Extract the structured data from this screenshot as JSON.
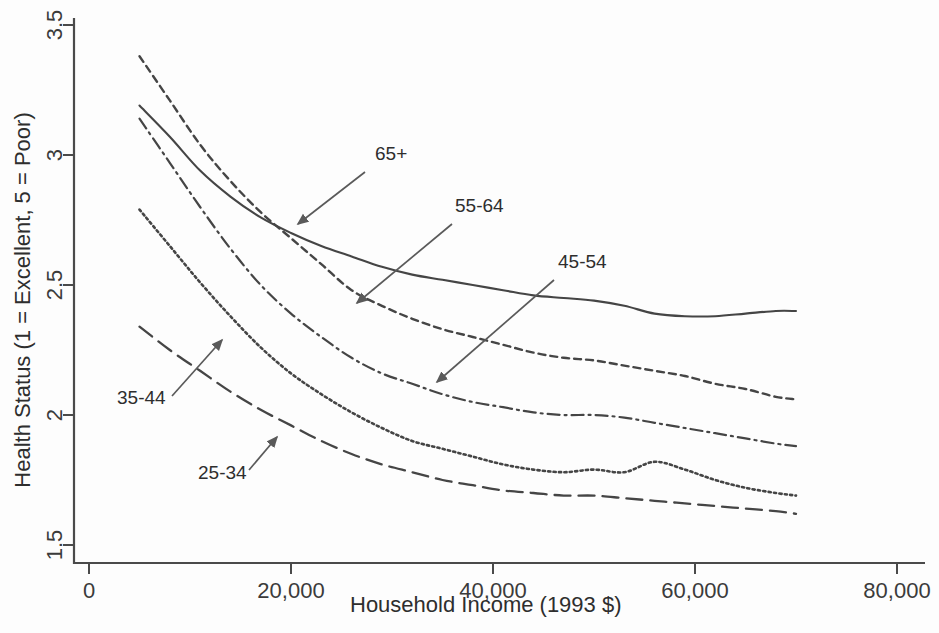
{
  "chart_data": {
    "type": "line",
    "title": "",
    "xlabel": "Household Income (1993 $)",
    "ylabel": "Health Status (1 = Excellent, 5 = Poor)",
    "xlim": [
      0,
      80000
    ],
    "ylim": [
      1.5,
      3.5
    ],
    "grid": false,
    "legend_position": "inline-annotations",
    "xticks": [
      "0",
      "20,000",
      "40,000",
      "60,000",
      "80,000"
    ],
    "xtick_values": [
      0,
      20000,
      40000,
      60000,
      80000
    ],
    "yticks": [
      "1.5",
      "2",
      "2.5",
      "3",
      "3.5"
    ],
    "ytick_values": [
      1.5,
      2,
      2.5,
      3,
      3.5
    ],
    "x": [
      5000,
      8000,
      11000,
      14000,
      17000,
      20000,
      23000,
      26000,
      29000,
      32000,
      35000,
      38000,
      41000,
      44000,
      47000,
      50000,
      53000,
      56000,
      59000,
      62000,
      65000,
      68000,
      70000
    ],
    "series": [
      {
        "name": "65+",
        "style": "solid",
        "values": [
          3.19,
          3.07,
          2.94,
          2.84,
          2.76,
          2.7,
          2.65,
          2.61,
          2.57,
          2.54,
          2.52,
          2.5,
          2.48,
          2.46,
          2.45,
          2.44,
          2.42,
          2.39,
          2.38,
          2.38,
          2.39,
          2.4,
          2.4
        ]
      },
      {
        "name": "55-64",
        "style": "dashed",
        "values": [
          3.38,
          3.21,
          3.04,
          2.9,
          2.78,
          2.68,
          2.58,
          2.48,
          2.42,
          2.37,
          2.33,
          2.3,
          2.27,
          2.24,
          2.22,
          2.21,
          2.19,
          2.17,
          2.15,
          2.12,
          2.1,
          2.07,
          2.06
        ]
      },
      {
        "name": "45-54",
        "style": "dashdot",
        "values": [
          3.14,
          2.97,
          2.8,
          2.64,
          2.5,
          2.39,
          2.3,
          2.22,
          2.16,
          2.12,
          2.08,
          2.05,
          2.03,
          2.01,
          2.0,
          2.0,
          1.99,
          1.97,
          1.95,
          1.93,
          1.91,
          1.89,
          1.88
        ]
      },
      {
        "name": "35-44",
        "style": "dotted",
        "values": [
          2.79,
          2.65,
          2.51,
          2.38,
          2.26,
          2.16,
          2.08,
          2.01,
          1.95,
          1.9,
          1.87,
          1.84,
          1.81,
          1.79,
          1.78,
          1.79,
          1.78,
          1.82,
          1.79,
          1.75,
          1.72,
          1.7,
          1.69
        ]
      },
      {
        "name": "25-34",
        "style": "longdash",
        "values": [
          2.34,
          2.25,
          2.17,
          2.09,
          2.02,
          1.96,
          1.9,
          1.85,
          1.81,
          1.78,
          1.75,
          1.73,
          1.71,
          1.7,
          1.69,
          1.69,
          1.68,
          1.67,
          1.66,
          1.65,
          1.64,
          1.63,
          1.62
        ]
      }
    ],
    "annotations": [
      {
        "text": "65+",
        "label_x": 375,
        "label_y": 160,
        "arrow_x1": 365,
        "arrow_y1": 172,
        "arrow_x2": 298,
        "arrow_y2": 224
      },
      {
        "text": "55-64",
        "label_x": 455,
        "label_y": 212,
        "arrow_x1": 452,
        "arrow_y1": 224,
        "arrow_x2": 357,
        "arrow_y2": 303
      },
      {
        "text": "45-54",
        "label_x": 558,
        "label_y": 268,
        "arrow_x1": 554,
        "arrow_y1": 280,
        "arrow_x2": 437,
        "arrow_y2": 382
      },
      {
        "text": "35-44",
        "label_x": 117,
        "label_y": 404,
        "arrow_x1": 172,
        "arrow_y1": 396,
        "arrow_x2": 222,
        "arrow_y2": 340
      },
      {
        "text": "25-34",
        "label_x": 198,
        "label_y": 479,
        "arrow_x1": 249,
        "arrow_y1": 470,
        "arrow_x2": 277,
        "arrow_y2": 437
      }
    ]
  }
}
